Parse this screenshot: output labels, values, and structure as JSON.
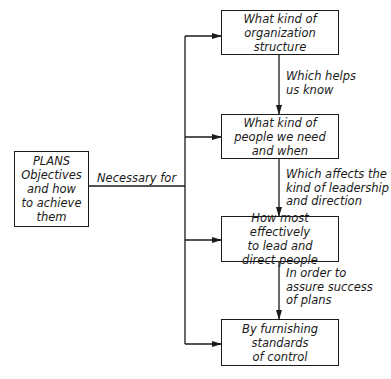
{
  "diagram": {
    "source_box": {
      "lines": [
        "PLANS",
        "Objectives",
        "and how",
        "to achieve",
        "them"
      ]
    },
    "source_connector_label": "Necessary for",
    "target_boxes": [
      {
        "lines": [
          "What kind of",
          "organization",
          "structure"
        ]
      },
      {
        "lines": [
          "What kind of",
          "people we need",
          "and when"
        ]
      },
      {
        "lines": [
          "How most effectively",
          "to lead and",
          "direct people"
        ]
      },
      {
        "lines": [
          "By furnishing",
          "standards",
          "of control"
        ]
      }
    ],
    "chain_labels": [
      {
        "lines": [
          "Which helps",
          "us know"
        ]
      },
      {
        "lines": [
          "Which affects the",
          "kind of leadership",
          "and direction"
        ]
      },
      {
        "lines": [
          "In order to",
          "assure success",
          "of plans"
        ]
      }
    ],
    "colors": {
      "stroke": "#1a1a1a",
      "background": "#ffffff"
    }
  }
}
